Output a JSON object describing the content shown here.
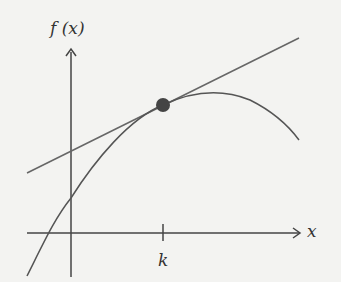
{
  "diagram": {
    "y_axis_label": "f (x)",
    "x_axis_label": "x",
    "tick_label": "k",
    "elements": [
      "y-axis",
      "x-axis",
      "concave-down curve f(x)",
      "tangent line at x=k",
      "point of tangency at x=k"
    ],
    "colors": {
      "stroke": "#555555",
      "point": "#444444",
      "background": "#f3f3f1"
    }
  }
}
